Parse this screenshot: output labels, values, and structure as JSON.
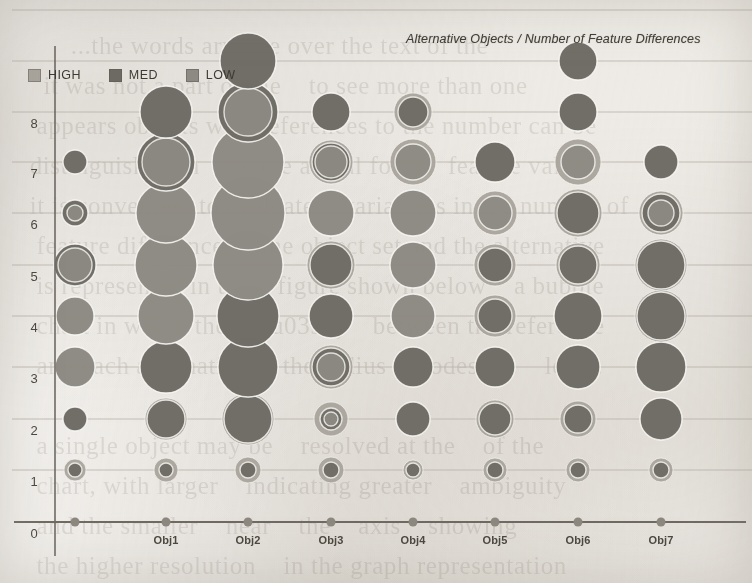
{
  "title": "Alternative Objects / Number of Feature Differences",
  "legend": {
    "items": [
      {
        "label": "HIGH",
        "color": "#a8a49c",
        "swatch_icon": "square-swatch"
      },
      {
        "label": "MED",
        "color": "#6d6a64",
        "swatch_icon": "square-swatch"
      },
      {
        "label": "LOW",
        "color": "#8d8a83",
        "swatch_icon": "square-swatch"
      }
    ]
  },
  "axes": {
    "y_ticks": [
      "8",
      "7",
      "6",
      "5",
      "4",
      "3",
      "2",
      "1",
      "0"
    ],
    "x_ticks": [
      "0",
      "Obj1",
      "Obj2",
      "Obj3",
      "Obj4",
      "Obj5",
      "Obj6",
      "Obj7"
    ],
    "origin_label": "0"
  },
  "colors": {
    "high": "#a8a49c",
    "med": "#6d6a64",
    "low": "#8d8a83",
    "gridline": "#b9b4ab",
    "axis": "#6f6a62",
    "tick_dot": "#8d887f",
    "text": "#3d3a34",
    "background": "#f3f1ee"
  },
  "bleed_text": "        ...the words arrange over the text of the\n    it was not a part of the    to see more than one\n   appears objects with references to the number can be\n  distinguish with    by the actual form    feature value\n  it is convenient to evaluate    variations in the number of\n   feature differences    the object set and the alternative\n   is represented in the    figure shown below    a bubble\n   chart in which the    (\\u0394)    between the reference\n   and each alternative     the radius encodes the    level.\n\n   a single object may be    resolved at the    of the\n   chart, with larger    indicating greater    ambiguity\n   and the smaller    near    the    axis    showing\n   the higher resolution    in the graph representation\n\n   and the object set    alternative objects    in    the\n   the Graph represents    the    model of a set of",
  "chart_data": {
    "type": "scatter",
    "title": "Alternative Objects / Number of Feature Differences",
    "xlabel": "",
    "ylabel": "",
    "xlim": [
      0,
      8
    ],
    "ylim": [
      0,
      9
    ],
    "grid": true,
    "legend_position": "top-left",
    "categories": [
      "0",
      "Obj1",
      "Obj2",
      "Obj3",
      "Obj4",
      "Obj5",
      "Obj6",
      "Obj7"
    ],
    "levels": [
      1,
      2,
      3,
      4,
      5,
      6,
      7,
      8,
      9
    ],
    "note": "Each marker is a set of concentric bubbles; the three series HIGH / MED / LOW are drawn over one another so the larger radius shows as a ring around the smaller.",
    "series": [
      {
        "name": "HIGH",
        "color": "#a8a49c",
        "points": [
          {
            "x": "0",
            "y": 1,
            "r": 11
          },
          {
            "x": "0",
            "y": 2,
            "r": 12
          },
          {
            "x": "0",
            "y": 3,
            "r": 20
          },
          {
            "x": "0",
            "y": 4,
            "r": 19
          },
          {
            "x": "0",
            "y": 5,
            "r": 21
          },
          {
            "x": "0",
            "y": 6,
            "r": 13
          },
          {
            "x": "0",
            "y": 7,
            "r": 12
          },
          {
            "x": "Obj1",
            "y": 1,
            "r": 12
          },
          {
            "x": "Obj1",
            "y": 2,
            "r": 21
          },
          {
            "x": "Obj1",
            "y": 3,
            "r": 26
          },
          {
            "x": "Obj1",
            "y": 4,
            "r": 28
          },
          {
            "x": "Obj1",
            "y": 5,
            "r": 31
          },
          {
            "x": "Obj1",
            "y": 6,
            "r": 30
          },
          {
            "x": "Obj1",
            "y": 7,
            "r": 29
          },
          {
            "x": "Obj1",
            "y": 8,
            "r": 26
          },
          {
            "x": "Obj2",
            "y": 1,
            "r": 13
          },
          {
            "x": "Obj2",
            "y": 2,
            "r": 26
          },
          {
            "x": "Obj2",
            "y": 3,
            "r": 30
          },
          {
            "x": "Obj2",
            "y": 4,
            "r": 31
          },
          {
            "x": "Obj2",
            "y": 5,
            "r": 35
          },
          {
            "x": "Obj2",
            "y": 6,
            "r": 37
          },
          {
            "x": "Obj2",
            "y": 7,
            "r": 36
          },
          {
            "x": "Obj2",
            "y": 8,
            "r": 30
          },
          {
            "x": "Obj2",
            "y": 9,
            "r": 28
          },
          {
            "x": "Obj3",
            "y": 1,
            "r": 13
          },
          {
            "x": "Obj3",
            "y": 2,
            "r": 17
          },
          {
            "x": "Obj3",
            "y": 3,
            "r": 22
          },
          {
            "x": "Obj3",
            "y": 4,
            "r": 22
          },
          {
            "x": "Obj3",
            "y": 5,
            "r": 24
          },
          {
            "x": "Obj3",
            "y": 6,
            "r": 23
          },
          {
            "x": "Obj3",
            "y": 7,
            "r": 22
          },
          {
            "x": "Obj3",
            "y": 8,
            "r": 19
          },
          {
            "x": "Obj4",
            "y": 1,
            "r": 10
          },
          {
            "x": "Obj4",
            "y": 2,
            "r": 17
          },
          {
            "x": "Obj4",
            "y": 3,
            "r": 20
          },
          {
            "x": "Obj4",
            "y": 4,
            "r": 22
          },
          {
            "x": "Obj4",
            "y": 5,
            "r": 23
          },
          {
            "x": "Obj4",
            "y": 6,
            "r": 23
          },
          {
            "x": "Obj4",
            "y": 7,
            "r": 23
          },
          {
            "x": "Obj4",
            "y": 8,
            "r": 19
          },
          {
            "x": "Obj5",
            "y": 1,
            "r": 12
          },
          {
            "x": "Obj5",
            "y": 2,
            "r": 19
          },
          {
            "x": "Obj5",
            "y": 3,
            "r": 20
          },
          {
            "x": "Obj5",
            "y": 4,
            "r": 21
          },
          {
            "x": "Obj5",
            "y": 5,
            "r": 21
          },
          {
            "x": "Obj5",
            "y": 6,
            "r": 22
          },
          {
            "x": "Obj5",
            "y": 7,
            "r": 20
          },
          {
            "x": "Obj6",
            "y": 1,
            "r": 12
          },
          {
            "x": "Obj6",
            "y": 2,
            "r": 18
          },
          {
            "x": "Obj6",
            "y": 3,
            "r": 22
          },
          {
            "x": "Obj6",
            "y": 4,
            "r": 24
          },
          {
            "x": "Obj6",
            "y": 5,
            "r": 22
          },
          {
            "x": "Obj6",
            "y": 6,
            "r": 24
          },
          {
            "x": "Obj6",
            "y": 7,
            "r": 23
          },
          {
            "x": "Obj6",
            "y": 8,
            "r": 19
          },
          {
            "x": "Obj6",
            "y": 9,
            "r": 19
          },
          {
            "x": "Obj7",
            "y": 1,
            "r": 12
          },
          {
            "x": "Obj7",
            "y": 2,
            "r": 21
          },
          {
            "x": "Obj7",
            "y": 3,
            "r": 25
          },
          {
            "x": "Obj7",
            "y": 4,
            "r": 26
          },
          {
            "x": "Obj7",
            "y": 5,
            "r": 26
          },
          {
            "x": "Obj7",
            "y": 6,
            "r": 22
          },
          {
            "x": "Obj7",
            "y": 7,
            "r": 17
          }
        ]
      },
      {
        "name": "MED",
        "color": "#6d6a64",
        "points": [
          {
            "x": "0",
            "y": 1,
            "r": 7
          },
          {
            "x": "0",
            "y": 2,
            "r": 12
          },
          {
            "x": "0",
            "y": 3,
            "r": 0
          },
          {
            "x": "0",
            "y": 4,
            "r": 0
          },
          {
            "x": "0",
            "y": 5,
            "r": 21
          },
          {
            "x": "0",
            "y": 6,
            "r": 13
          },
          {
            "x": "0",
            "y": 7,
            "r": 12
          },
          {
            "x": "Obj1",
            "y": 1,
            "r": 7
          },
          {
            "x": "Obj1",
            "y": 2,
            "r": 19
          },
          {
            "x": "Obj1",
            "y": 3,
            "r": 26
          },
          {
            "x": "Obj1",
            "y": 4,
            "r": 0
          },
          {
            "x": "Obj1",
            "y": 5,
            "r": 0
          },
          {
            "x": "Obj1",
            "y": 6,
            "r": 0
          },
          {
            "x": "Obj1",
            "y": 7,
            "r": 29
          },
          {
            "x": "Obj1",
            "y": 8,
            "r": 26
          },
          {
            "x": "Obj2",
            "y": 1,
            "r": 8
          },
          {
            "x": "Obj2",
            "y": 2,
            "r": 24
          },
          {
            "x": "Obj2",
            "y": 3,
            "r": 30
          },
          {
            "x": "Obj2",
            "y": 4,
            "r": 31
          },
          {
            "x": "Obj2",
            "y": 5,
            "r": 0
          },
          {
            "x": "Obj2",
            "y": 6,
            "r": 0
          },
          {
            "x": "Obj2",
            "y": 7,
            "r": 0
          },
          {
            "x": "Obj2",
            "y": 8,
            "r": 30
          },
          {
            "x": "Obj2",
            "y": 9,
            "r": 28
          },
          {
            "x": "Obj3",
            "y": 1,
            "r": 8
          },
          {
            "x": "Obj3",
            "y": 2,
            "r": 11
          },
          {
            "x": "Obj3",
            "y": 3,
            "r": 19
          },
          {
            "x": "Obj3",
            "y": 4,
            "r": 22
          },
          {
            "x": "Obj3",
            "y": 5,
            "r": 21
          },
          {
            "x": "Obj3",
            "y": 6,
            "r": 0
          },
          {
            "x": "Obj3",
            "y": 7,
            "r": 19
          },
          {
            "x": "Obj3",
            "y": 8,
            "r": 19
          },
          {
            "x": "Obj4",
            "y": 1,
            "r": 7
          },
          {
            "x": "Obj4",
            "y": 2,
            "r": 17
          },
          {
            "x": "Obj4",
            "y": 3,
            "r": 20
          },
          {
            "x": "Obj4",
            "y": 4,
            "r": 0
          },
          {
            "x": "Obj4",
            "y": 5,
            "r": 0
          },
          {
            "x": "Obj4",
            "y": 6,
            "r": 0
          },
          {
            "x": "Obj4",
            "y": 7,
            "r": 0
          },
          {
            "x": "Obj4",
            "y": 8,
            "r": 15
          },
          {
            "x": "Obj5",
            "y": 1,
            "r": 8
          },
          {
            "x": "Obj5",
            "y": 2,
            "r": 16
          },
          {
            "x": "Obj5",
            "y": 3,
            "r": 20
          },
          {
            "x": "Obj5",
            "y": 4,
            "r": 17
          },
          {
            "x": "Obj5",
            "y": 5,
            "r": 17
          },
          {
            "x": "Obj5",
            "y": 6,
            "r": 0
          },
          {
            "x": "Obj5",
            "y": 7,
            "r": 20
          },
          {
            "x": "Obj6",
            "y": 1,
            "r": 8
          },
          {
            "x": "Obj6",
            "y": 2,
            "r": 14
          },
          {
            "x": "Obj6",
            "y": 3,
            "r": 22
          },
          {
            "x": "Obj6",
            "y": 4,
            "r": 24
          },
          {
            "x": "Obj6",
            "y": 5,
            "r": 19
          },
          {
            "x": "Obj6",
            "y": 6,
            "r": 21
          },
          {
            "x": "Obj6",
            "y": 7,
            "r": 0
          },
          {
            "x": "Obj6",
            "y": 8,
            "r": 19
          },
          {
            "x": "Obj6",
            "y": 9,
            "r": 19
          },
          {
            "x": "Obj7",
            "y": 1,
            "r": 8
          },
          {
            "x": "Obj7",
            "y": 2,
            "r": 21
          },
          {
            "x": "Obj7",
            "y": 3,
            "r": 25
          },
          {
            "x": "Obj7",
            "y": 4,
            "r": 24
          },
          {
            "x": "Obj7",
            "y": 5,
            "r": 24
          },
          {
            "x": "Obj7",
            "y": 6,
            "r": 19
          },
          {
            "x": "Obj7",
            "y": 7,
            "r": 17
          }
        ]
      },
      {
        "name": "LOW",
        "color": "#8d8a83",
        "points": [
          {
            "x": "0",
            "y": 3,
            "r": 20
          },
          {
            "x": "0",
            "y": 4,
            "r": 19
          },
          {
            "x": "0",
            "y": 5,
            "r": 17
          },
          {
            "x": "0",
            "y": 6,
            "r": 8
          },
          {
            "x": "Obj1",
            "y": 4,
            "r": 28
          },
          {
            "x": "Obj1",
            "y": 5,
            "r": 31
          },
          {
            "x": "Obj1",
            "y": 6,
            "r": 30
          },
          {
            "x": "Obj1",
            "y": 7,
            "r": 24
          },
          {
            "x": "Obj1",
            "y": 8,
            "r": 0
          },
          {
            "x": "Obj2",
            "y": 5,
            "r": 35
          },
          {
            "x": "Obj2",
            "y": 6,
            "r": 37
          },
          {
            "x": "Obj2",
            "y": 7,
            "r": 36
          },
          {
            "x": "Obj2",
            "y": 8,
            "r": 24
          },
          {
            "x": "Obj3",
            "y": 2,
            "r": 7
          },
          {
            "x": "Obj3",
            "y": 3,
            "r": 14
          },
          {
            "x": "Obj3",
            "y": 6,
            "r": 23
          },
          {
            "x": "Obj3",
            "y": 7,
            "r": 16
          },
          {
            "x": "Obj4",
            "y": 4,
            "r": 22
          },
          {
            "x": "Obj4",
            "y": 5,
            "r": 23
          },
          {
            "x": "Obj4",
            "y": 6,
            "r": 23
          },
          {
            "x": "Obj4",
            "y": 7,
            "r": 18
          },
          {
            "x": "Obj4",
            "y": 8,
            "r": 0
          },
          {
            "x": "Obj5",
            "y": 6,
            "r": 17
          },
          {
            "x": "Obj6",
            "y": 7,
            "r": 17
          },
          {
            "x": "Obj7",
            "y": 6,
            "r": 13
          }
        ]
      }
    ]
  },
  "geometry": {
    "plot": {
      "width": 752,
      "height": 583
    },
    "x_positions": {
      "0": 75,
      "Obj1": 166,
      "Obj2": 248,
      "Obj3": 331,
      "Obj4": 413,
      "Obj5": 495,
      "Obj6": 578,
      "Obj7": 661
    },
    "y_positions": {
      "0": 522,
      "1": 470,
      "2": 419,
      "3": 367,
      "4": 316,
      "5": 265,
      "6": 213,
      "7": 162,
      "8": 112,
      "9": 61
    },
    "axis_x_y": 522,
    "axis_y_x": 55,
    "gridline_x_start": 12,
    "gridline_x_end": 752
  }
}
